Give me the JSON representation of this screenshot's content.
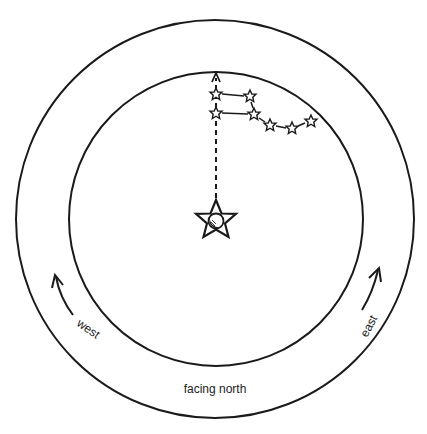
{
  "diagram": {
    "center_label": "facing north",
    "left_label": "west",
    "right_label": "east",
    "central_star": "Polaris (north star)",
    "constellation": "Big Dipper",
    "colors": {
      "line": "#1a1a1a",
      "background": "#ffffff"
    },
    "icons": {
      "polaris": "star-with-moon-icon",
      "dipper_star": "small-star-icon",
      "rotation_arrow": "curved-arrow-icon"
    }
  }
}
